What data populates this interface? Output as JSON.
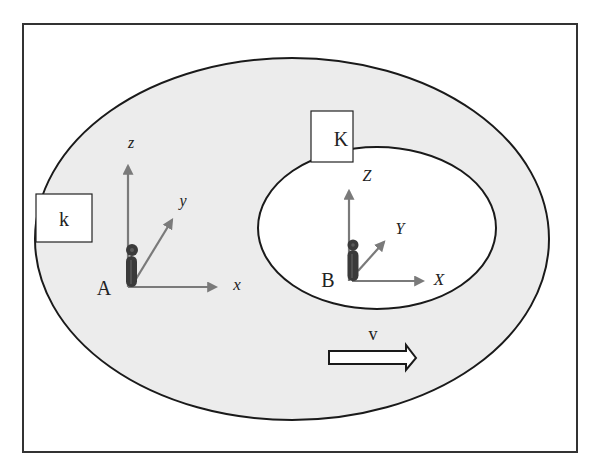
{
  "diagram": {
    "colors": {
      "frame": "#333333",
      "outer_fill": "#ececec",
      "inner_fill": "#ffffff",
      "axis": "#7a7a7a",
      "figure": "#3a3a3a",
      "stroke": "#1a1a1a"
    },
    "outer_frame_label": "k",
    "inner_frame_label": "K",
    "observer_a": {
      "label": "A",
      "axes": {
        "x": "x",
        "y": "y",
        "z": "z"
      }
    },
    "observer_b": {
      "label": "B",
      "axes": {
        "x": "X",
        "y": "Y",
        "z": "Z"
      }
    },
    "velocity": {
      "label": "v"
    }
  }
}
